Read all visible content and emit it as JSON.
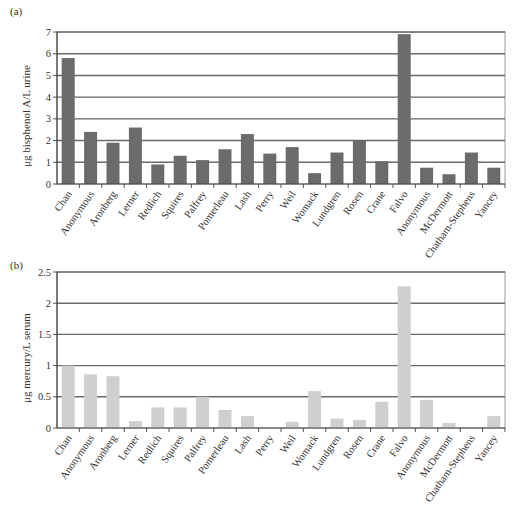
{
  "chart_data": [
    {
      "panel_label": "(a)",
      "type": "bar",
      "title": "",
      "xlabel": "",
      "ylabel": "μg bisphenol A/L urine",
      "ylim": [
        0,
        7
      ],
      "yticks": [
        "0",
        "1",
        "2",
        "3",
        "4",
        "5",
        "6",
        "7"
      ],
      "ytick_values": [
        0,
        1,
        2,
        3,
        4,
        5,
        6,
        7
      ],
      "grid": true,
      "legend": null,
      "bar_color": "#6b6b6b",
      "categories": [
        "Chan",
        "Anonymous",
        "Aronberg",
        "Lerner",
        "Redlich",
        "Squires",
        "Palfrey",
        "Pomerleau",
        "Lash",
        "Perry",
        "Weil",
        "Womack",
        "Lundgren",
        "Rosen",
        "Crane",
        "Falvo",
        "Anonymous",
        "McDermott",
        "Chatham-Stephens",
        "Yancey"
      ],
      "values": [
        5.8,
        2.4,
        1.9,
        2.6,
        0.9,
        1.3,
        1.1,
        1.6,
        2.3,
        1.4,
        1.7,
        0.5,
        1.45,
        2.0,
        1.05,
        6.9,
        0.75,
        0.45,
        1.45,
        0.75
      ]
    },
    {
      "panel_label": "(b)",
      "type": "bar",
      "title": "",
      "xlabel": "",
      "ylabel": "μg mercury/L serum",
      "ylim": [
        0,
        2.5
      ],
      "yticks": [
        "0",
        "0.5",
        "1",
        "1.5",
        "2",
        "2.5"
      ],
      "ytick_values": [
        0,
        0.5,
        1,
        1.5,
        2,
        2.5
      ],
      "grid": true,
      "legend": null,
      "bar_color": "#cfcfcf",
      "categories": [
        "Chan",
        "Anonymous",
        "Aronberg",
        "Lerner",
        "Redlich",
        "Squires",
        "Palfrey",
        "Pomerleau",
        "Lash",
        "Perry",
        "Weil",
        "Womack",
        "Lundgren",
        "Rosen",
        "Crane",
        "Falvo",
        "Anonymous",
        "McDermott",
        "Chatham-Stephens",
        "Yancey"
      ],
      "values": [
        1.0,
        0.86,
        0.83,
        0.11,
        0.33,
        0.33,
        0.5,
        0.29,
        0.19,
        0,
        0.1,
        0.59,
        0.15,
        0.13,
        0.42,
        2.27,
        0.45,
        0.08,
        0,
        0.19
      ]
    }
  ]
}
